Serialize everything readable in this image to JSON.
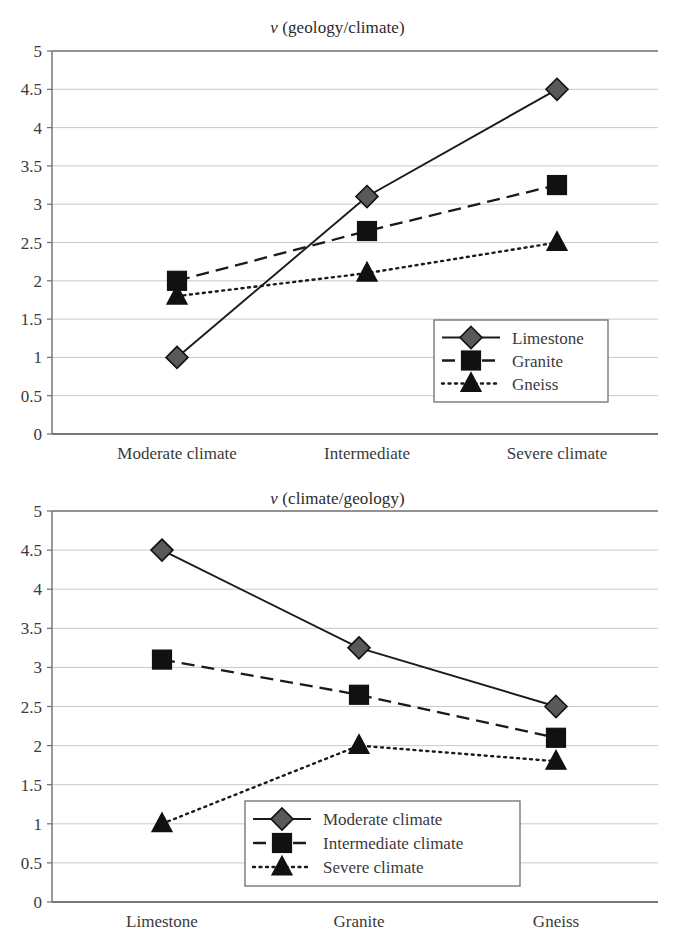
{
  "figure": {
    "background_color": "#ffffff",
    "text_color": "#333333",
    "gridline_color": "#c9c9c9",
    "axis_color": "#6e6e6e",
    "marker_fill_diamond": "#595959",
    "marker_fill_square": "#111111",
    "marker_fill_triangle": "#111111"
  },
  "charts": [
    {
      "id": "chart-1",
      "title_nu": "ν",
      "title_rest": " (geology/climate)",
      "title_full": "ν (geology/climate)",
      "legend_position": "bottom-right-inside",
      "chart_data": {
        "type": "line",
        "title": "ν (geology/climate)",
        "xlabel": "",
        "ylabel": "",
        "ylim": [
          0,
          5
        ],
        "yticks": [
          "0",
          "0.5",
          "1",
          "1.5",
          "2",
          "2.5",
          "3",
          "3.5",
          "4",
          "4.5",
          "5"
        ],
        "ytick_values": [
          0,
          0.5,
          1,
          1.5,
          2,
          2.5,
          3,
          3.5,
          4,
          4.5,
          5
        ],
        "grid": true,
        "legend": [
          "Limestone",
          "Granite",
          "Gneiss"
        ],
        "categories": [
          "Moderate climate",
          "Intermediate",
          "Severe climate"
        ],
        "series": [
          {
            "name": "Limestone",
            "values": [
              1.0,
              3.1,
              4.5
            ],
            "marker": "diamond",
            "linestyle": "solid"
          },
          {
            "name": "Granite",
            "values": [
              2.0,
              2.65,
              3.25
            ],
            "marker": "square",
            "linestyle": "dashed"
          },
          {
            "name": "Gneiss",
            "values": [
              1.8,
              2.1,
              2.5
            ],
            "marker": "triangle",
            "linestyle": "dotted"
          }
        ]
      }
    },
    {
      "id": "chart-2",
      "title_nu": "ν",
      "title_rest": " (climate/geology)",
      "title_full": "ν (climate/geology)",
      "legend_position": "bottom-center-inside",
      "chart_data": {
        "type": "line",
        "title": "ν (climate/geology)",
        "xlabel": "",
        "ylabel": "",
        "ylim": [
          0,
          5
        ],
        "yticks": [
          "0",
          "0.5",
          "1",
          "1.5",
          "2",
          "2.5",
          "3",
          "3.5",
          "4",
          "4.5",
          "5"
        ],
        "ytick_values": [
          0,
          0.5,
          1,
          1.5,
          2,
          2.5,
          3,
          3.5,
          4,
          4.5,
          5
        ],
        "grid": true,
        "legend": [
          "Moderate climate",
          "Intermediate climate",
          "Severe climate"
        ],
        "categories": [
          "Limestone",
          "Granite",
          "Gneiss"
        ],
        "series": [
          {
            "name": "Moderate climate",
            "values": [
              4.5,
              3.25,
              2.5
            ],
            "marker": "diamond",
            "linestyle": "solid"
          },
          {
            "name": "Intermediate climate",
            "values": [
              3.1,
              2.65,
              2.1
            ],
            "marker": "square",
            "linestyle": "dashed"
          },
          {
            "name": "Severe climate",
            "values": [
              1.0,
              2.0,
              1.8
            ],
            "marker": "triangle",
            "linestyle": "dotted"
          }
        ]
      }
    }
  ]
}
